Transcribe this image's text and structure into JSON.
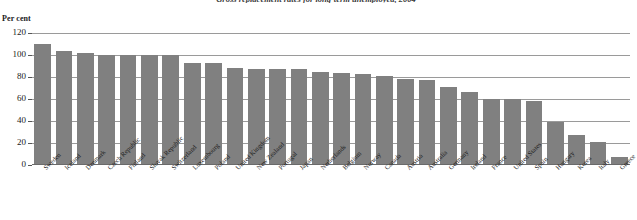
{
  "chart_data": {
    "type": "bar",
    "title": "Gross replacement rates for long-term unemployed, 2004",
    "subtitle": "",
    "xlabel": "",
    "ylabel": "Per cent",
    "ylim": [
      0,
      120
    ],
    "yticks": [
      0,
      20,
      40,
      60,
      80,
      100,
      120
    ],
    "ytick_labels": [
      "0",
      "20",
      "40",
      "60",
      "80",
      "100",
      "120"
    ],
    "grid": true,
    "legend": false,
    "bar_color": "#808080",
    "categories": [
      "Sweden",
      "Iceland",
      "Denmark",
      "Czech Republic",
      "Finland",
      "Slovak Republic",
      "Switzerland",
      "Luxembourg",
      "Poland",
      "United Kingdom",
      "New Zealand",
      "Portugal",
      "Japan",
      "Netherlands",
      "Belgium",
      "Norway",
      "Canada",
      "Austria",
      "Australia",
      "Germany",
      "Ireland",
      "France",
      "United States",
      "Spain",
      "Hungary",
      "Korea",
      "Italy",
      "Greece"
    ],
    "values": [
      110,
      104,
      102,
      100,
      100,
      100,
      100,
      93,
      93,
      88,
      87,
      87,
      87,
      85,
      84,
      83,
      81,
      78,
      77,
      71,
      66,
      60,
      60,
      58,
      39,
      27,
      21,
      7
    ]
  },
  "axis": {
    "unit_label": "Per cent"
  }
}
